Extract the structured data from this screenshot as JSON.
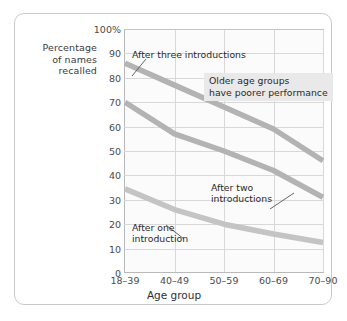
{
  "chart_data": {
    "type": "line",
    "title": "",
    "xlabel": "Age group",
    "ylabel": "Percentage of names recalled",
    "ylabel_lines": [
      "Percentage",
      "of names",
      "recalled"
    ],
    "categories": [
      "18–39",
      "40–49",
      "50–59",
      "60–69",
      "70–90"
    ],
    "ylim": [
      0,
      100
    ],
    "yticks": [
      0,
      10,
      20,
      30,
      40,
      50,
      60,
      70,
      80,
      90,
      100
    ],
    "ytick_labels": [
      "0",
      "10",
      "20",
      "30",
      "40",
      "50",
      "60",
      "70",
      "80",
      "90",
      "100%"
    ],
    "grid": true,
    "legend": "none (inline callout labels)",
    "series": [
      {
        "name": "After three introductions",
        "values": [
          86,
          77,
          68,
          59,
          46
        ],
        "color": "#b3b3b3"
      },
      {
        "name": "After two introductions",
        "values": [
          70,
          57,
          50,
          42,
          31
        ],
        "color": "#b3b3b3"
      },
      {
        "name": "After one introduction",
        "values": [
          34.5,
          26,
          20,
          16,
          12.5
        ],
        "color": "#c4c4c4"
      }
    ],
    "annotations": [
      {
        "id": "after-three-introductions",
        "text": "After three introductions",
        "lines": [
          "After three introductions"
        ],
        "points_to_series": "After three introductions"
      },
      {
        "id": "after-two-introductions",
        "text": "After two introductions",
        "lines": [
          "After two",
          "introductions"
        ],
        "points_to_series": "After two introductions"
      },
      {
        "id": "after-one-introduction",
        "text": "After one introduction",
        "lines": [
          "After one",
          "introduction"
        ],
        "points_to_series": "After one introduction"
      },
      {
        "id": "note-older-age-groups",
        "text": "Older age groups have poorer performance",
        "lines": [
          "Older age groups",
          "have poorer performance"
        ],
        "style": "shaded-box",
        "background": "#e9e9e9"
      }
    ],
    "colors": {
      "plot_background": "#fbfbfb",
      "gridlines": "#d8d8d8",
      "axis": "#b9b9b9",
      "frame_border": "#c9c9c9",
      "text": "#3a3a3a"
    }
  }
}
